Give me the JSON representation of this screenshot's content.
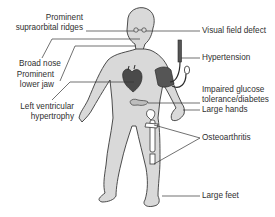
{
  "diagram": {
    "labels": {
      "supraorbital_1": "Prominent",
      "supraorbital_2": "supraorbital ridges",
      "broad_nose": "Broad nose",
      "lower_jaw_1": "Prominent",
      "lower_jaw_2": "lower jaw",
      "lvh_1": "Left ventricular",
      "lvh_2": "hypertrophy",
      "visual_field": "Visual field defect",
      "hypertension": "Hypertension",
      "glucose_1": "Impaired glucose",
      "glucose_2": "tolerance/diabetes",
      "large_hands": "Large hands",
      "osteoarthritis": "Osteoarthritis",
      "large_feet": "Large feet"
    },
    "colors": {
      "skin_fill": "#d9d9d9",
      "outline": "#3a3a3a",
      "leader_line": "#333333",
      "heart": "#4a4a4a",
      "bp_cuff": "#555555",
      "bone": "#ffffff"
    }
  }
}
